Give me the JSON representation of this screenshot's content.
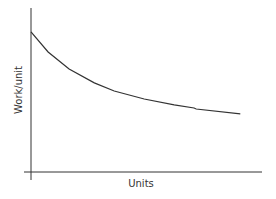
{
  "chart_data": {
    "type": "line",
    "title": "",
    "xlabel": "Units",
    "ylabel": "Work/unit",
    "grid": false,
    "legend": null,
    "ticks": false,
    "x": [
      0,
      0.74,
      1.65,
      2.74,
      3.6,
      4.9,
      6.2,
      7.06,
      7.15,
      9.06
    ],
    "series": [
      {
        "name": "Work/unit",
        "values": [
          8.54,
          7.32,
          6.28,
          5.43,
          4.94,
          4.45,
          4.09,
          3.9,
          3.84,
          3.54
        ]
      }
    ],
    "xlim": [
      0,
      10
    ],
    "ylim": [
      0,
      10
    ],
    "line_color": "#333333",
    "axis_color": "#333333"
  }
}
